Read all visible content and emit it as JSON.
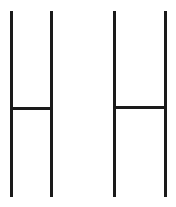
{
  "image": {
    "width": 176,
    "height": 207,
    "background_color": "#ffffff",
    "description": "Two tall narrow letter-H glyphs drawn with thin near-black strokes on a plain white background",
    "subject": "letter-h-pair",
    "stroke_color": "#1a1a1a",
    "stroke_width": 3,
    "glyph_count": 2
  },
  "glyphs": [
    {
      "id": "glyph-left",
      "character": "H",
      "left_stem_x": 10,
      "right_stem_x": 50,
      "stem_top_y": 11,
      "stem_bottom_y": 197,
      "crossbar_y": 107,
      "crossbar_thickness": 3,
      "stem_width": 3,
      "height": 186,
      "width": 40
    },
    {
      "id": "glyph-right",
      "character": "H",
      "left_stem_x": 113,
      "right_stem_x": 164,
      "stem_top_y": 11,
      "stem_bottom_y": 197,
      "crossbar_y": 106,
      "crossbar_thickness": 3,
      "stem_width": 3,
      "height": 186,
      "width": 51
    }
  ]
}
